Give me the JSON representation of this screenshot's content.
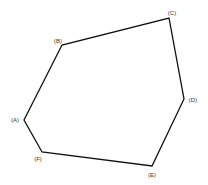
{
  "diagram": {
    "type": "hexagon",
    "stroke_color": "#111111",
    "background": "#ffffff",
    "vertices": [
      {
        "id": "A",
        "label": "(A)",
        "x": 24,
        "y": 120,
        "lx": 15,
        "ly": 122
      },
      {
        "id": "B",
        "label": "(B)",
        "x": 62,
        "y": 45,
        "lx": 58,
        "ly": 43
      },
      {
        "id": "C",
        "label": "(C)",
        "x": 169,
        "y": 18,
        "lx": 172,
        "ly": 15
      },
      {
        "id": "D",
        "label": "(D)",
        "x": 184,
        "y": 99,
        "lx": 193,
        "ly": 102
      },
      {
        "id": "E",
        "label": "(E)",
        "x": 152,
        "y": 166,
        "lx": 152,
        "ly": 177
      },
      {
        "id": "F",
        "label": "(F)",
        "x": 42,
        "y": 152,
        "lx": 38,
        "ly": 161
      }
    ],
    "edges": [
      [
        "A",
        "B"
      ],
      [
        "B",
        "C"
      ],
      [
        "C",
        "D"
      ],
      [
        "D",
        "E"
      ],
      [
        "E",
        "F"
      ],
      [
        "F",
        "A"
      ]
    ]
  }
}
